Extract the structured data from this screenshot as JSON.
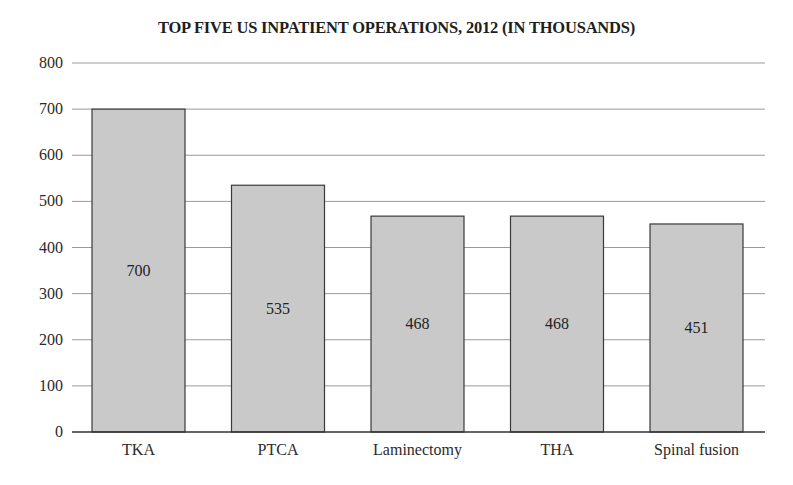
{
  "chart_data": {
    "type": "bar",
    "title": "TOP FIVE US INPATIENT OPERATIONS, 2012 (IN THOUSANDS)",
    "xlabel": "",
    "ylabel": "",
    "categories": [
      "TKA",
      "PTCA",
      "Laminectomy",
      "THA",
      "Spinal fusion"
    ],
    "values": [
      700,
      535,
      468,
      468,
      451
    ],
    "value_labels": [
      "700",
      "535",
      "468",
      "468",
      "451"
    ],
    "ylim": [
      0,
      800
    ],
    "yticks": [
      0,
      100,
      200,
      300,
      400,
      500,
      600,
      700,
      800
    ],
    "grid": true,
    "legend": null,
    "bar_fill": "#c9c9c9",
    "bar_edge": "#3a3a3a",
    "grid_color": "#9a9a9a"
  }
}
